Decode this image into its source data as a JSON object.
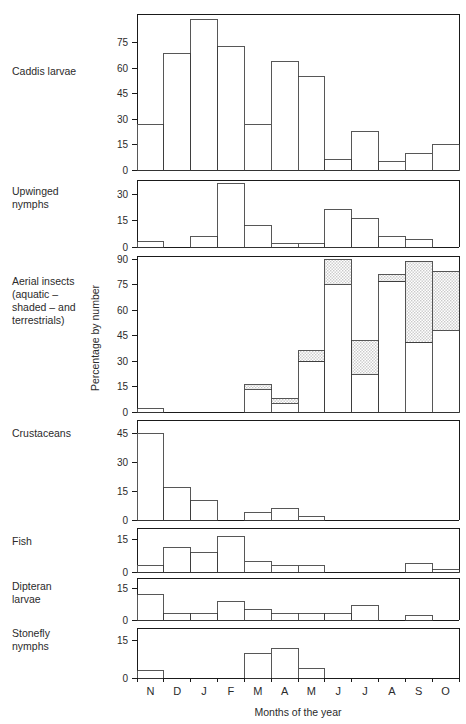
{
  "figure": {
    "y_axis_title": "Percentage by number",
    "x_axis_title": "Months of the year",
    "months": [
      "N",
      "D",
      "J",
      "F",
      "M",
      "A",
      "M",
      "J",
      "J",
      "A",
      "S",
      "O"
    ],
    "shade_legend_note": "aquatic – shaded – and terrestrials",
    "colors": {
      "axis": "#1a1a1a",
      "bar_stroke": "#3a3a3a",
      "bar_open_fill": "#ffffff",
      "bar_shaded_fill": "#d9d9d9",
      "background": "#ffffff"
    }
  },
  "chart_data": {
    "type": "bar",
    "title": "",
    "xlabel": "Months of the year",
    "ylabel": "Percentage by number",
    "grid": false,
    "legend": "none",
    "categories": [
      "N",
      "D",
      "J",
      "F",
      "M",
      "A",
      "M",
      "J",
      "J",
      "A",
      "S",
      "O"
    ],
    "panels": [
      {
        "name": "caddis-larvae",
        "label": "Caddis larvae",
        "ylim": [
          0,
          92
        ],
        "yticks": [
          0,
          15,
          30,
          45,
          60,
          75
        ],
        "ytick_labels": [
          "0",
          "15",
          "30",
          "45",
          "60",
          "75"
        ],
        "series": [
          {
            "name": "Caddis larvae",
            "shaded": false,
            "values": [
              27,
              69,
              89,
              73,
              27,
              64,
              55,
              6,
              23,
              5,
              10,
              15
            ]
          }
        ]
      },
      {
        "name": "upwinged-nymphs",
        "label": "Upwinged\nnymphs",
        "label_lines": [
          "Upwinged",
          "nymphs"
        ],
        "ylim": [
          0,
          38
        ],
        "yticks": [
          0,
          15,
          30
        ],
        "ytick_labels": [
          "0",
          "15",
          "30"
        ],
        "series": [
          {
            "name": "Upwinged nymphs",
            "shaded": false,
            "values": [
              3,
              0,
              6,
              36,
              12,
              2,
              2,
              21,
              16,
              6,
              4,
              0
            ]
          }
        ]
      },
      {
        "name": "aerial-insects",
        "label": "Aerial insects (aquatic – shaded – and terrestrials)",
        "label_lines": [
          "Aerial insects",
          "(aquatic –",
          "shaded – and",
          "terrestrials)"
        ],
        "ylim": [
          0,
          92
        ],
        "yticks": [
          0,
          15,
          30,
          45,
          60,
          75,
          90
        ],
        "ytick_labels": [
          "0",
          "15",
          "30",
          "45",
          "60",
          "75",
          "90"
        ],
        "series": [
          {
            "name": "aquatic (unshaded lower portion)",
            "shaded": false,
            "values": [
              2,
              0,
              0,
              0,
              13,
              5,
              30,
              75,
              22,
              77,
              41,
              48
            ]
          },
          {
            "name": "terrestrial (shaded upper portion)",
            "shaded": true,
            "values": [
              0,
              0,
              0,
              0,
              3,
              3,
              6,
              15,
              20,
              4,
              48,
              35
            ]
          }
        ],
        "totals": [
          2,
          0,
          0,
          0,
          16,
          8,
          36,
          90,
          42,
          81,
          89,
          83
        ]
      },
      {
        "name": "crustaceans",
        "label": "Crustaceans",
        "ylim": [
          0,
          52
        ],
        "yticks": [
          0,
          15,
          30,
          45
        ],
        "ytick_labels": [
          "0",
          "15",
          "30",
          "45"
        ],
        "series": [
          {
            "name": "Crustaceans",
            "shaded": false,
            "values": [
              45,
              17,
              10,
              0,
              4,
              6,
              2,
              0,
              0,
              0,
              0,
              0
            ]
          }
        ]
      },
      {
        "name": "fish",
        "label": "Fish",
        "ylim": [
          0,
          20
        ],
        "yticks": [
          0,
          15
        ],
        "ytick_labels": [
          "0",
          "15"
        ],
        "series": [
          {
            "name": "Fish",
            "shaded": false,
            "values": [
              3,
              11,
              9,
              16,
              5,
              3,
              3,
              0,
              0,
              0,
              4,
              1
            ]
          }
        ]
      },
      {
        "name": "dipteran-larvae",
        "label": "Dipteran\nlarvae",
        "label_lines": [
          "Dipteran",
          "larvae"
        ],
        "ylim": [
          0,
          20
        ],
        "yticks": [
          0,
          15
        ],
        "ytick_labels": [
          "0",
          "15"
        ],
        "series": [
          {
            "name": "Dipteran larvae",
            "shaded": false,
            "values": [
              12,
              3,
              3,
              9,
              5,
              3,
              3,
              3,
              7,
              0,
              2,
              0
            ]
          }
        ]
      },
      {
        "name": "stonefly-nymphs",
        "label": "Stonefly\nnymphs",
        "label_lines": [
          "Stonefly",
          "nymphs"
        ],
        "ylim": [
          0,
          20
        ],
        "yticks": [
          0,
          15
        ],
        "ytick_labels": [
          "0",
          "15"
        ],
        "series": [
          {
            "name": "Stonefly nymphs",
            "shaded": false,
            "values": [
              3,
              0,
              0,
              0,
              10,
              12,
              4,
              0,
              0,
              0,
              0,
              0
            ]
          }
        ]
      }
    ]
  }
}
